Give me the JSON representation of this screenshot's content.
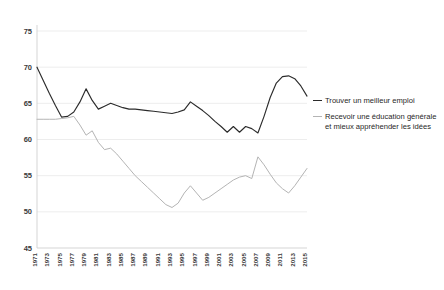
{
  "chart_data": {
    "type": "line",
    "title": "",
    "subtitle": "",
    "xlabel": "",
    "ylabel": "",
    "ylim": [
      45,
      75
    ],
    "yticks": [
      45,
      50,
      55,
      60,
      65,
      70,
      75
    ],
    "grid": true,
    "legend_position": "right",
    "x": [
      1971,
      1972,
      1973,
      1974,
      1975,
      1976,
      1977,
      1978,
      1979,
      1980,
      1981,
      1982,
      1983,
      1984,
      1985,
      1986,
      1987,
      1988,
      1989,
      1990,
      1991,
      1992,
      1993,
      1994,
      1995,
      1996,
      1997,
      1998,
      1999,
      2000,
      2001,
      2002,
      2003,
      2004,
      2005,
      2006,
      2007,
      2008,
      2009,
      2010,
      2011,
      2012,
      2013,
      2014,
      2015
    ],
    "xtick_labels": [
      "1971",
      "1973",
      "1975",
      "1977",
      "1979",
      "1981",
      "1983",
      "1985",
      "1987",
      "1989",
      "1991",
      "1993",
      "1995",
      "1997",
      "1999",
      "2001",
      "2003",
      "2005",
      "2007",
      "2009",
      "2011",
      "2013",
      "2015"
    ],
    "series": [
      {
        "name": "Trouver un meilleur emploi",
        "color": "#2b2b2b",
        "values": [
          70.0,
          68.2,
          66.4,
          64.7,
          63.1,
          63.2,
          63.8,
          65.2,
          67.0,
          65.4,
          64.2,
          64.6,
          65.0,
          64.7,
          64.4,
          64.2,
          64.2,
          64.1,
          64.0,
          63.9,
          63.8,
          63.7,
          63.6,
          63.8,
          64.1,
          65.2,
          64.6,
          64.0,
          63.3,
          62.5,
          61.8,
          61.0,
          61.8,
          61.0,
          61.8,
          61.5,
          60.9,
          63.2,
          65.8,
          67.8,
          68.7,
          68.8,
          68.4,
          67.4,
          66.0
        ]
      },
      {
        "name": "Recevoir une éducation générale et mieux appréhender les idées",
        "color": "#b4b4b4",
        "values": [
          62.8,
          62.8,
          62.8,
          62.8,
          62.9,
          63.0,
          63.2,
          62.0,
          60.6,
          61.2,
          59.6,
          58.6,
          58.8,
          58.0,
          57.0,
          56.0,
          55.0,
          54.2,
          53.4,
          52.6,
          51.8,
          51.0,
          50.6,
          51.2,
          52.6,
          53.6,
          52.6,
          51.6,
          52.0,
          52.6,
          53.2,
          53.8,
          54.4,
          54.8,
          55.0,
          54.6,
          57.6,
          56.5,
          55.2,
          54.0,
          53.2,
          52.6,
          53.6,
          54.8,
          56.0
        ]
      }
    ]
  }
}
